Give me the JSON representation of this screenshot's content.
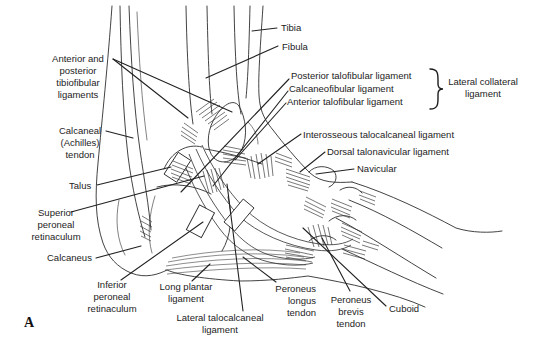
{
  "figure": {
    "panel_label": "A"
  },
  "colors": {
    "line": "#2e2e2e",
    "leader": "#222222",
    "text": "#1c1c1c",
    "background": "#ffffff"
  },
  "labels": {
    "tibia": "Tibia",
    "fibula": "Fibula",
    "anterior_posterior_tibiofibular": "Anterior and\nposterior\ntibiofibular\nligaments",
    "calcaneal_tendon": "Calcaneal\n(Achilles)\ntendon",
    "talus": "Talus",
    "superior_peroneal_retinaculum": "Superior\nperoneal\nretinaculum",
    "calcaneus": "Calcaneus",
    "inferior_peroneal_retinaculum": "Inferior\nperoneal\nretinaculum",
    "long_plantar_ligament": "Long plantar\nligament",
    "lateral_talocalcaneal_ligament": "Lateral talocalcaneal\nligament",
    "peroneus_longus_tendon": "Peroneus\nlongus\ntendon",
    "peroneus_brevis_tendon": "Peroneus\nbrevis\ntendon",
    "cuboid": "Cuboid",
    "posterior_talofibular_ligament": "Posterior talofibular ligament",
    "calcaneofibular_ligament": "Calcaneofibular ligament",
    "anterior_talofibular_ligament": "Anterior talofibular ligament",
    "lateral_collateral_ligament": "Lateral collateral\nligament",
    "interosseous_talocalcaneal_ligament": "Interosseous talocalcaneal ligament",
    "dorsal_talonavicular_ligament": "Dorsal talonavicular ligament",
    "navicular": "Navicular"
  }
}
